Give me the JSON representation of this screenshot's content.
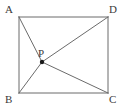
{
  "figure": {
    "kind": "plane-geometry-diagram",
    "shape": "rectangle-with-interior-point",
    "background_color": "#ffffff",
    "stroke_color": "#6b6b6b",
    "stroke_width": 1,
    "label_color": "#3a3a3a",
    "point_color": "#1a1a1a",
    "width": 127,
    "height": 110,
    "vertices": [
      {
        "id": "A",
        "label": "A",
        "x": 19,
        "y": 17,
        "label_x": 5,
        "label_y": 4
      },
      {
        "id": "D",
        "label": "D",
        "x": 108,
        "y": 17,
        "label_x": 109,
        "label_y": 4
      },
      {
        "id": "B",
        "label": "B",
        "x": 19,
        "y": 93,
        "label_x": 5,
        "label_y": 94
      },
      {
        "id": "C",
        "label": "C",
        "x": 108,
        "y": 93,
        "label_x": 109,
        "label_y": 94
      }
    ],
    "interior_points": [
      {
        "id": "P",
        "label": "P",
        "x": 42,
        "y": 62,
        "label_x": 38,
        "label_y": 48,
        "marker": "filled-dot",
        "radius": 2.2
      }
    ],
    "rectangle_sides": [
      {
        "name": "AD",
        "from": "A",
        "to": "D"
      },
      {
        "name": "DC",
        "from": "D",
        "to": "C"
      },
      {
        "name": "CB",
        "from": "C",
        "to": "B"
      },
      {
        "name": "BA",
        "from": "B",
        "to": "A"
      }
    ],
    "segments": [
      {
        "name": "PA",
        "from": "P",
        "to": "A"
      },
      {
        "name": "PB",
        "from": "P",
        "to": "B"
      },
      {
        "name": "PC",
        "from": "P",
        "to": "C"
      },
      {
        "name": "PD",
        "from": "P",
        "to": "D"
      }
    ],
    "notes": {
      "collinear": "B, P, D lie on a straight line (diagonal BD)"
    }
  }
}
